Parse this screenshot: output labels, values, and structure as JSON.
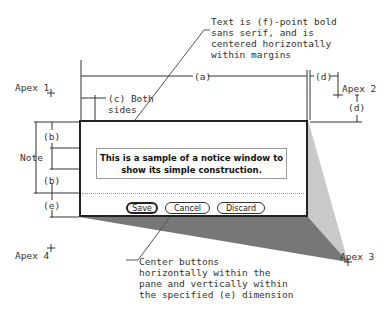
{
  "diagram": {
    "type": "notice-window-construction",
    "annotations": {
      "text_note": "Text is (f)-point bold\nsans serif, and is\ncentered horizontally\nwithin margins",
      "apex1": "Apex 1",
      "apex2": "Apex 2",
      "apex3": "Apex 3",
      "apex4": "Apex 4",
      "a": "(a)",
      "d_top": "(d)",
      "d_side": "(d)",
      "c": "(c) Both\nsides",
      "b_top": "(b)",
      "b_bottom": "(b)",
      "e": "(e)",
      "note": "Note",
      "button_note": "Center buttons\nhorizontally within the\npane and vertically within\nthe specified (e) dimension"
    },
    "window": {
      "message": "This is a sample of a notice window to\nshow its simple construction.",
      "buttons": [
        {
          "label": "Save",
          "default": true
        },
        {
          "label": "Cancel",
          "default": false
        },
        {
          "label": "Discard",
          "default": false
        }
      ]
    }
  }
}
